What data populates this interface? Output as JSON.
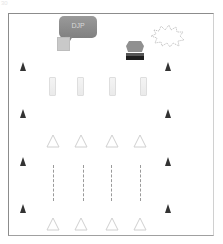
{
  "corner_text": "30",
  "bubble": {
    "label": "DJP",
    "color": "#8a8a8a"
  },
  "colors": {
    "frame": "#8c8c8c",
    "cone": "#333333",
    "triangle_outline": "#d0d0d0",
    "rect_outline": "#dedede",
    "dash": "#9a9a9a"
  },
  "elements": {
    "cones_left": [
      66,
      113,
      161,
      208
    ],
    "cones_right": [
      66,
      113,
      161,
      208
    ],
    "rect_columns": [
      49,
      77,
      109,
      140
    ],
    "triangle_columns": [
      46,
      74,
      105,
      133
    ],
    "dash_columns": [
      53,
      83,
      111,
      140
    ]
  },
  "icons": {
    "speech_bubble": "speech-bubble-icon",
    "small_square": "square-icon",
    "podium": "podium-icon",
    "starburst": "starburst-icon",
    "cone": "cone-icon",
    "triangle": "triangle-icon",
    "rectangle": "rectangle-icon"
  }
}
